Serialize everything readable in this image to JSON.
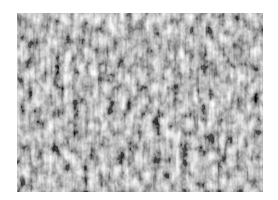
{
  "image": {
    "description": "Grayscale granular surface texture",
    "alt": "Grayscale noise-like texture",
    "colors": {
      "background": "#ffffff",
      "mid_gray": "#8a8a8a",
      "dark": "#2e2e2e",
      "light": "#e6e6e6"
    }
  }
}
